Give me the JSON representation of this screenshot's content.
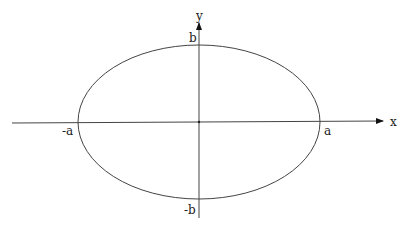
{
  "diagram": {
    "type": "ellipse",
    "axes": {
      "x_label": "x",
      "y_label": "y"
    },
    "labels": {
      "a": "a",
      "neg_a": "-a",
      "b": "b",
      "neg_b": "-b"
    },
    "stroke_color": "#444444"
  }
}
